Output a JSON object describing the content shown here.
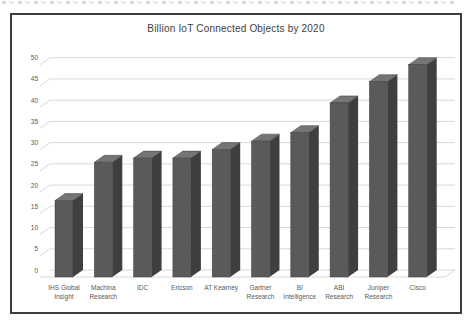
{
  "chart_data": {
    "type": "bar",
    "subtype": "3d-column",
    "title": "Billion IoT Connected Objects by 2020",
    "categories": [
      "IHS Global Insight",
      "Machina Research",
      "IDC",
      "Ericson",
      "AT Kearney",
      "Gartner Research",
      "BI Intelligence",
      "ABI Research",
      "Juniper Research",
      "Cisco"
    ],
    "category_label_lines": [
      [
        "IHS Global",
        "Insight"
      ],
      [
        "Machina",
        "Research"
      ],
      [
        "IDC"
      ],
      [
        "Ericson"
      ],
      [
        "AT Kearney"
      ],
      [
        "Gartner",
        "Research"
      ],
      [
        "BI",
        "Intelligence"
      ],
      [
        "ABI",
        "Research"
      ],
      [
        "Juniper",
        "Research"
      ],
      [
        "Cisco"
      ]
    ],
    "values": [
      18,
      27,
      28,
      28,
      30,
      32,
      34,
      41,
      46,
      50
    ],
    "xlabel": "",
    "ylabel": "",
    "ylim": [
      0,
      50
    ],
    "ytick_step": 5,
    "yticklabels": [
      "0",
      "5",
      "10",
      "15",
      "20",
      "25",
      "30",
      "35",
      "40",
      "45",
      "50"
    ],
    "grid": true,
    "legend": false,
    "colors": {
      "bar_front": "#5a5a5a",
      "bar_side": "#3f3f3f",
      "bar_top": "#757575",
      "gridline": "#d9d9d9",
      "tick_label": "#595959",
      "category_label": "#595959",
      "title": "#404040",
      "frame_border": "#3d3d3d",
      "background": "#ffffff"
    }
  }
}
